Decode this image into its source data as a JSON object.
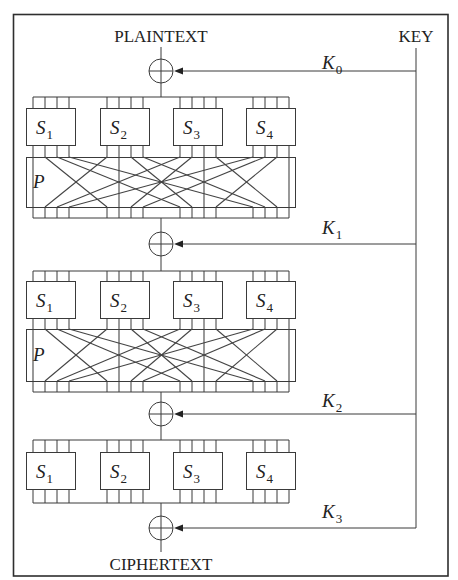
{
  "figure": {
    "plaintext_label": "PLAINTEXT",
    "ciphertext_label": "CIPHERTEXT",
    "key_label": "KEY",
    "permutation_label": "P",
    "sbox_prefix": "S",
    "sbox_indices": [
      "1",
      "2",
      "3",
      "4"
    ],
    "round_keys": [
      {
        "prefix": "K",
        "index": "0"
      },
      {
        "prefix": "K",
        "index": "1"
      },
      {
        "prefix": "K",
        "index": "2"
      },
      {
        "prefix": "K",
        "index": "3"
      }
    ],
    "rounds": [
      {
        "has_sboxes": true,
        "has_permutation": true
      },
      {
        "has_sboxes": true,
        "has_permutation": true
      },
      {
        "has_sboxes": true,
        "has_permutation": false
      }
    ],
    "bits_per_sbox": 4,
    "permutation_rule": "bit j of S-box i -> bit i of S-box j (transpose)",
    "colors": {
      "line": "#3a3a3a",
      "background": "#ffffff",
      "text": "#222222"
    }
  }
}
